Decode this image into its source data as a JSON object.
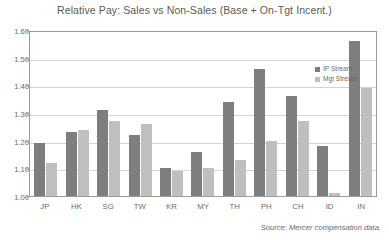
{
  "chart_data": {
    "type": "bar",
    "title": "Relative Pay: Sales vs Non-Sales (Base + On-Tgt Incent.)",
    "xlabel": "",
    "ylabel": "",
    "ylim": [
      1.0,
      1.6
    ],
    "ytick_step": 0.1,
    "ytick_labels": [
      "1.60",
      "1.50",
      "1.40",
      "1.30",
      "1.20",
      "1.10",
      "1.00"
    ],
    "grid": true,
    "legend_position": "top-right-inside",
    "categories": [
      "JP",
      "HK",
      "SG",
      "TW",
      "KR",
      "MY",
      "TH",
      "PH",
      "CH",
      "ID",
      "IN"
    ],
    "series": [
      {
        "name": "IP Stream",
        "color": "#7e7e7e",
        "values": [
          1.19,
          1.23,
          1.31,
          1.22,
          1.1,
          1.16,
          1.34,
          1.46,
          1.36,
          1.18,
          1.56
        ]
      },
      {
        "name": "Mgt Stream",
        "color": "#bfbfbf",
        "values": [
          1.12,
          1.24,
          1.27,
          1.26,
          1.09,
          1.1,
          1.13,
          1.2,
          1.27,
          1.01,
          1.39
        ]
      }
    ],
    "source_note": "Source: Mercer compensation data."
  },
  "colors": {
    "ip_stream": "#7e7e7e",
    "mgt_stream": "#bfbfbf",
    "axis": "#9a9a9a",
    "gridline": "#d4d4d4",
    "text": "#6a6a6a",
    "background": "#ffffff"
  }
}
